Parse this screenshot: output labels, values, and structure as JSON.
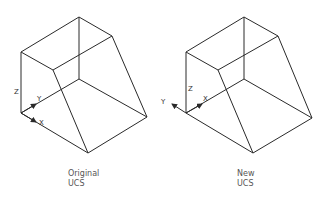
{
  "figures": [
    {
      "id": "original",
      "caption_line1": "Original",
      "caption_line2": "UCS",
      "axes": {
        "z": "Z",
        "y": "Y",
        "x": "X"
      }
    },
    {
      "id": "new",
      "caption_line1": "New",
      "caption_line2": "UCS",
      "axes": {
        "z": "Z",
        "y": "Y",
        "x": "X"
      }
    }
  ],
  "colors": {
    "line": "#2a2a2a",
    "caption": "#555555",
    "background": "#ffffff"
  }
}
